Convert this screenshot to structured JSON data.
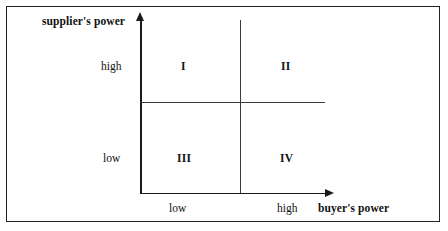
{
  "figure": {
    "axes": {
      "y_axis_title": "supplier's power",
      "x_axis_title": "buyer's power",
      "y_ticks": [
        "high",
        "low"
      ],
      "x_ticks": [
        "low",
        "high"
      ]
    },
    "quadrants": [
      {
        "label": "I",
        "position": "top-left",
        "y_level": "high",
        "x_level": "low"
      },
      {
        "label": "II",
        "position": "top-right",
        "y_level": "high",
        "x_level": "high"
      },
      {
        "label": "III",
        "position": "bottom-left",
        "y_level": "low",
        "x_level": "low"
      },
      {
        "label": "IV",
        "position": "bottom-right",
        "y_level": "low",
        "x_level": "high"
      }
    ],
    "colors": {
      "background": "#ffffff",
      "border": "#222222",
      "axis": "#1a1a1a",
      "divider": "#3a3a3a",
      "text": "#111111"
    }
  },
  "chart_data": {
    "type": "scatter",
    "title": "",
    "xlabel": "buyer's power",
    "ylabel": "supplier's power",
    "x_tick_labels": [
      "low",
      "high"
    ],
    "y_tick_labels": [
      "low",
      "high"
    ],
    "grid": true,
    "legend": "none",
    "cells": [
      {
        "row": "high",
        "col": "low",
        "text": "I"
      },
      {
        "row": "high",
        "col": "high",
        "text": "II"
      },
      {
        "row": "low",
        "col": "low",
        "text": "III"
      },
      {
        "row": "low",
        "col": "high",
        "text": "IV"
      }
    ]
  }
}
